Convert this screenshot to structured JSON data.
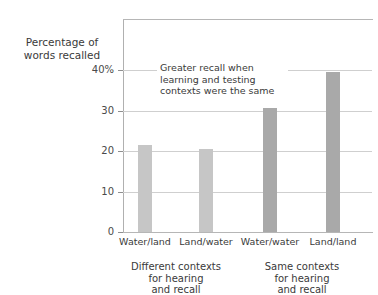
{
  "chart_data": {
    "type": "bar",
    "title": "",
    "xlabel": "",
    "ylabel": "Percentage of words recalled",
    "ylim": [
      0,
      45
    ],
    "grid": true,
    "legend": "none",
    "categories": [
      "Water/land",
      "Land/water",
      "Water/water",
      "Land/land"
    ],
    "values": [
      21.5,
      20.5,
      30.5,
      39.5
    ],
    "bar_colors": [
      "#c6c6c6",
      "#c6c6c6",
      "#a9a9a9",
      "#a9a9a9"
    ],
    "ytick_labels": [
      "0",
      "10",
      "20",
      "30",
      "40%"
    ],
    "ytick_values": [
      0,
      10,
      20,
      30,
      40
    ],
    "annotations": [
      {
        "text": "Greater recall when learning and testing contexts were the same",
        "line1": "Greater recall when",
        "line2": "learning and testing",
        "line3": "contexts were the same"
      }
    ],
    "groups": [
      {
        "label": "Different contexts for hearing and recall",
        "line1": "Different contexts",
        "line2": "for hearing",
        "line3": "and recall",
        "categories": [
          "Water/land",
          "Land/water"
        ]
      },
      {
        "label": "Same contexts for hearing and recall",
        "line1": "Same contexts",
        "line2": "for hearing",
        "line3": "and recall",
        "categories": [
          "Water/water",
          "Land/land"
        ]
      }
    ]
  },
  "axis": {
    "y_title_line1": "Percentage of",
    "y_title_line2": "words recalled"
  },
  "colors": {
    "bar_light": "#c6c6c6",
    "bar_dark": "#a9a9a9",
    "gridline": "#cfcfcf",
    "axis": "#b0b0b0",
    "text": "#3a3a3a"
  }
}
